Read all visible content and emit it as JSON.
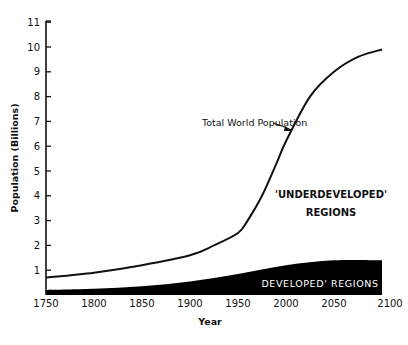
{
  "chart_data": {
    "type": "area",
    "title": "",
    "xlabel": "Year",
    "ylabel": "Population (Billions)",
    "xlim": [
      1750,
      2100
    ],
    "ylim": [
      0,
      11
    ],
    "x_ticks": [
      1750,
      1800,
      1850,
      1900,
      1950,
      2000,
      2050,
      2100
    ],
    "y_ticks": [
      1,
      2,
      3,
      4,
      5,
      6,
      7,
      8,
      9,
      10,
      11
    ],
    "grid": false,
    "series": [
      {
        "name": "Total World Population",
        "style": "line",
        "x": [
          1750,
          1800,
          1850,
          1900,
          1925,
          1950,
          1960,
          1975,
          1990,
          2000,
          2025,
          2050,
          2075,
          2100
        ],
        "values": [
          0.7,
          0.9,
          1.2,
          1.6,
          2.0,
          2.5,
          3.0,
          4.0,
          5.3,
          6.2,
          8.0,
          9.0,
          9.6,
          9.9
        ]
      },
      {
        "name": "Developed Regions",
        "style": "filled-area",
        "color": "#000000",
        "x": [
          1750,
          1800,
          1850,
          1900,
          1950,
          2000,
          2050,
          2100
        ],
        "values": [
          0.2,
          0.25,
          0.35,
          0.55,
          0.85,
          1.2,
          1.4,
          1.4
        ]
      }
    ],
    "annotations": [
      {
        "text": "Total World Population",
        "arrow_to_year": 2000
      },
      {
        "text": "'UNDERDEVELOPED'",
        "line2": "REGIONS"
      },
      {
        "text": "DEVELOPED' REGIONS",
        "inside": "black band"
      }
    ]
  },
  "labels": {
    "x_axis_title": "Year",
    "y_axis_title": "Population (Billions)",
    "total_curve_label": "Total World Population",
    "underdeveloped_line1": "'UNDERDEVELOPED'",
    "underdeveloped_line2": "REGIONS",
    "developed_label": "DEVELOPED' REGIONS"
  },
  "colors": {
    "ink": "#111111",
    "fill": "#000000",
    "background": "#ffffff"
  }
}
